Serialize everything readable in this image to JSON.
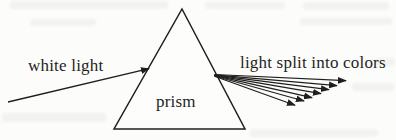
{
  "figure": {
    "labels": {
      "incident_ray": "white light",
      "prism": "prism",
      "dispersed_rays": "light split into colors"
    },
    "colors": {
      "ink": "#1f1f1f",
      "paper": "#fcfcfa"
    },
    "dispersed_ray_count": 7
  }
}
